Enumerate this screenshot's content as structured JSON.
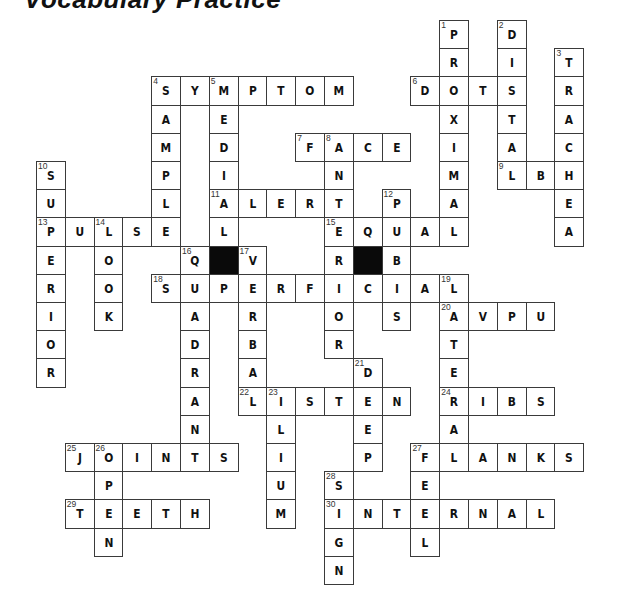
{
  "title": "Vocabulary Practice",
  "grid": {
    "origin_x": 36,
    "origin_y": 20,
    "col_pitch": 28.8,
    "row_pitch": 28.2,
    "black_squares": [
      {
        "row": 8,
        "col": 6
      },
      {
        "row": 8,
        "col": 11
      }
    ]
  },
  "words": [
    {
      "number": 1,
      "direction": "down",
      "row": 0,
      "col": 14,
      "answer": "PROXIMAL"
    },
    {
      "number": 2,
      "direction": "down",
      "row": 0,
      "col": 16,
      "answer": "DISTAL"
    },
    {
      "number": 3,
      "direction": "down",
      "row": 1,
      "col": 18,
      "answer": "TRACHEA"
    },
    {
      "number": 4,
      "direction": "across",
      "row": 2,
      "col": 4,
      "answer": "SYMPTOM"
    },
    {
      "number": 4,
      "direction": "down",
      "row": 2,
      "col": 4,
      "answer": "SAMPLE"
    },
    {
      "number": 5,
      "direction": "down",
      "row": 2,
      "col": 6,
      "answer": "MEDIAL"
    },
    {
      "number": 6,
      "direction": "across",
      "row": 2,
      "col": 13,
      "answer": "DOTS"
    },
    {
      "number": 7,
      "direction": "across",
      "row": 4,
      "col": 9,
      "answer": "FACE"
    },
    {
      "number": 8,
      "direction": "down",
      "row": 4,
      "col": 10,
      "answer": "ANTERIOR"
    },
    {
      "number": 9,
      "direction": "across",
      "row": 5,
      "col": 16,
      "answer": "ABC"
    },
    {
      "number": 10,
      "direction": "down",
      "row": 5,
      "col": 0,
      "answer": "SUPERIOR"
    },
    {
      "number": 11,
      "direction": "across",
      "row": 6,
      "col": 6,
      "answer": "ALERT"
    },
    {
      "number": 12,
      "direction": "down",
      "row": 6,
      "col": 12,
      "answer": "PUBIS"
    },
    {
      "number": 13,
      "direction": "across",
      "row": 7,
      "col": 0,
      "answer": "PULSE"
    },
    {
      "number": 14,
      "direction": "down",
      "row": 7,
      "col": 2,
      "answer": "LOOK"
    },
    {
      "number": 15,
      "direction": "across",
      "row": 7,
      "col": 10,
      "answer": "EQUAL"
    },
    {
      "number": 16,
      "direction": "down",
      "row": 8,
      "col": 5,
      "answer": "QUADRANT"
    },
    {
      "number": 17,
      "direction": "down",
      "row": 8,
      "col": 7,
      "answer": "VERBAL"
    },
    {
      "number": 18,
      "direction": "across",
      "row": 9,
      "col": 4,
      "answer": "SUPERFICIAL"
    },
    {
      "number": 19,
      "direction": "down",
      "row": 9,
      "col": 14,
      "answer": "LATERAL"
    },
    {
      "number": 20,
      "direction": "across",
      "row": 10,
      "col": 14,
      "answer": "AVPU"
    },
    {
      "number": 21,
      "direction": "down",
      "row": 12,
      "col": 11,
      "answer": "DEEP"
    },
    {
      "number": 22,
      "direction": "across",
      "row": 13,
      "col": 7,
      "answer": "LISTEN"
    },
    {
      "number": 23,
      "direction": "down",
      "row": 13,
      "col": 8,
      "answer": "ILIUM"
    },
    {
      "number": 24,
      "direction": "across",
      "row": 13,
      "col": 14,
      "answer": "RIBS"
    },
    {
      "number": 25,
      "direction": "across",
      "row": 15,
      "col": 1,
      "answer": "JOINTS"
    },
    {
      "number": 26,
      "direction": "down",
      "row": 15,
      "col": 2,
      "answer": "OPEN"
    },
    {
      "number": 27,
      "direction": "across",
      "row": 15,
      "col": 13,
      "answer": "FLANKS"
    },
    {
      "number": 27,
      "direction": "down",
      "row": 15,
      "col": 13,
      "answer": "FEEL"
    },
    {
      "number": 28,
      "direction": "down",
      "row": 16,
      "col": 10,
      "answer": "SIGN"
    },
    {
      "number": 29,
      "direction": "across",
      "row": 17,
      "col": 1,
      "answer": "TEETH"
    },
    {
      "number": 30,
      "direction": "across",
      "row": 17,
      "col": 10,
      "answer": "INTERNAL"
    }
  ]
}
